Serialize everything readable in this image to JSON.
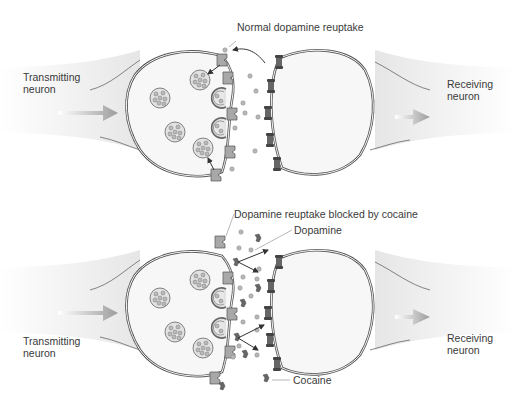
{
  "panels": [
    {
      "id": "normal",
      "offset_y": 0,
      "labels": {
        "transmitting": "Transmitting neuron",
        "transmitting_lines": [
          "Transmitting",
          "neuron"
        ],
        "receiving_lines": [
          "Receiving",
          "neuron"
        ],
        "callout": "Normal dopamine reuptake"
      },
      "label_pos": {
        "transmitting": [
          23,
          74
        ],
        "receiving": [
          446,
          79
        ],
        "callout": [
          237,
          21
        ]
      }
    },
    {
      "id": "cocaine",
      "offset_y": 200,
      "labels": {
        "transmitting_lines": [
          "Transmitting",
          "neuron"
        ],
        "receiving_lines": [
          "Receiving",
          "neuron"
        ],
        "callout": "Dopamine reuptake blocked by cocaine",
        "dopamine": "Dopamine",
        "cocaine": "Cocaine"
      },
      "label_pos": {
        "transmitting": [
          23,
          335
        ],
        "receiving": [
          446,
          331
        ],
        "callout": [
          234,
          208
        ],
        "dopamine": [
          294,
          226
        ],
        "cocaine": [
          293,
          372
        ]
      }
    }
  ],
  "colors": {
    "membrane": "#5a5a5a",
    "cell_fill": "#f6f6f6",
    "vesicle": "#d8d8d8",
    "dopamine": "#b4b4b4",
    "transporter": "#9a9a9a",
    "receptor": "#4a4a4a",
    "cocaine": "#6a6a6a",
    "arrow": "#a8a8a8",
    "text": "#3a3a3a"
  }
}
